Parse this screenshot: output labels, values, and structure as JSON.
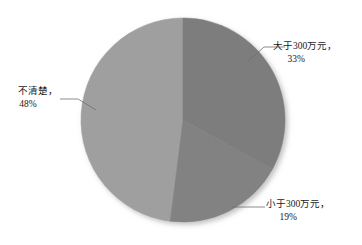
{
  "chart_data": {
    "type": "pie",
    "title": "",
    "subtitle": "",
    "xlabel": "",
    "ylabel": "",
    "grid": false,
    "legend_position": "none",
    "label_format": "name_and_percent_outside_with_leader_lines",
    "start_angle_deg": 0,
    "direction": "clockwise",
    "categories": [
      "大于300万元，",
      "小于300万元，",
      "不清楚，"
    ],
    "values": [
      33,
      19,
      48
    ],
    "value_labels": [
      "33%",
      "19%",
      "48%"
    ],
    "colors": [
      "#7d7d7d",
      "#828282",
      "#9f9f9f"
    ],
    "slices": [
      {
        "label": "大于300万元，",
        "percent_label": "33%",
        "value": 33,
        "color": "#7d7d7d",
        "start_angle_deg": 0,
        "end_angle_deg": 118.8
      },
      {
        "label": "小于300万元，",
        "percent_label": "19%",
        "value": 19,
        "color": "#828282",
        "start_angle_deg": 118.8,
        "end_angle_deg": 187.2
      },
      {
        "label": "不清楚，",
        "percent_label": "48%",
        "value": 48,
        "color": "#9f9f9f",
        "start_angle_deg": 187.2,
        "end_angle_deg": 360
      }
    ]
  },
  "labels": {
    "large": {
      "name": "大于300万元，",
      "percent": "33%"
    },
    "small": {
      "name": "小于300万元，",
      "percent": "19%"
    },
    "unknown": {
      "name": "不清楚，",
      "percent": "48%"
    }
  },
  "style": {
    "background": "#ffffff",
    "text_color": "#1a1a1a",
    "leader_line_color": "#6f6f6f",
    "slice_border_color": "#b8b8b8"
  }
}
